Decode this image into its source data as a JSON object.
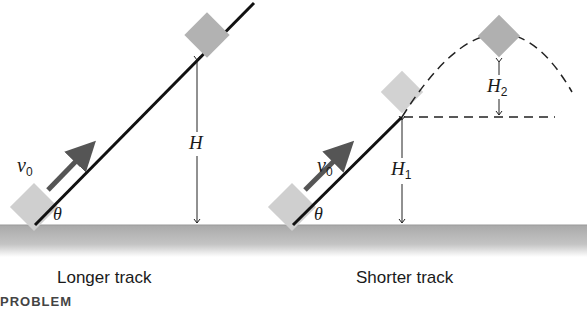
{
  "figure": {
    "panels": [
      {
        "caption": "Longer track",
        "velocity_symbol": "v",
        "velocity_subscript": "0",
        "angle_symbol": "θ",
        "height_symbol": "H",
        "height_subscript": ""
      },
      {
        "caption": "Shorter track",
        "velocity_symbol": "v",
        "velocity_subscript": "0",
        "angle_symbol": "θ",
        "height1_symbol": "H",
        "height1_subscript": "1",
        "height2_symbol": "H",
        "height2_subscript": "2"
      }
    ],
    "cut_off_text": "PROBLEM",
    "colors": {
      "track": "#111111",
      "block": "#c8c8c8",
      "block_top": "#b0b0b0",
      "arrow": "#555555",
      "ground": "#b5b5b5"
    }
  }
}
